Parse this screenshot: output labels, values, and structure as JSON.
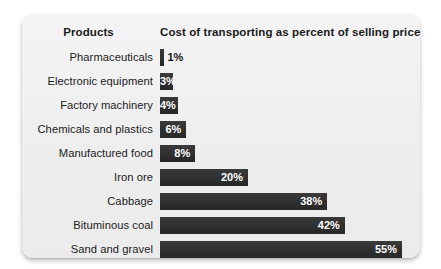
{
  "card": {
    "background_color": "#f1f1f1",
    "bar_color": "#323232",
    "text_color": "#1b1b1b"
  },
  "header": {
    "products_label": "Products",
    "value_label": "Cost of transporting as percent of selling price"
  },
  "chart_data": {
    "type": "bar",
    "orientation": "horizontal",
    "title": "",
    "xlabel": "Cost of transporting as percent of selling price",
    "ylabel": "Products",
    "grid": false,
    "legend": false,
    "xlim": [
      0,
      55
    ],
    "value_suffix": "%",
    "categories": [
      "Pharmaceuticals",
      "Electronic equipment",
      "Factory machinery",
      "Chemicals and plastics",
      "Manufactured food",
      "Iron ore",
      "Cabbage",
      "Bituminous coal",
      "Sand and gravel"
    ],
    "values": [
      1,
      3,
      4,
      6,
      8,
      20,
      38,
      42,
      55
    ],
    "value_labels": [
      "1%",
      "3%",
      "4%",
      "6%",
      "8%",
      "20%",
      "38%",
      "42%",
      "55%"
    ],
    "label_placement": [
      "outside",
      "inside",
      "inside",
      "inside",
      "inside",
      "inside",
      "inside",
      "inside",
      "inside"
    ]
  }
}
